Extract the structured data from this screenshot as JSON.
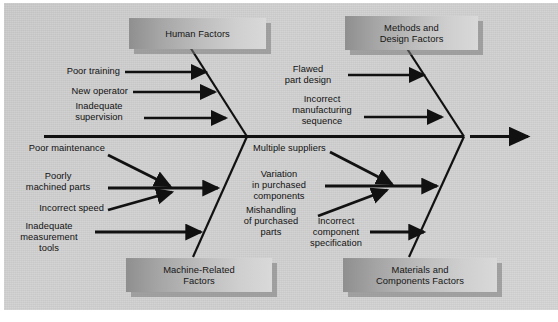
{
  "diagram": {
    "type": "fishbone-cause-and-effect",
    "categories": [
      {
        "id": "human-factors",
        "label": "Human Factors",
        "position": "top-left"
      },
      {
        "id": "methods-and-design-factors",
        "label": "Methods and\nDesign Factors",
        "position": "top-right"
      },
      {
        "id": "machine-related-factors",
        "label": "Machine-Related\nFactors",
        "position": "bottom-left"
      },
      {
        "id": "materials-and-components-factors",
        "label": "Materials and\nComponents Factors",
        "position": "bottom-right"
      }
    ],
    "causes": {
      "human_factors": [
        {
          "id": "poor-training",
          "label": "Poor training"
        },
        {
          "id": "new-operator",
          "label": "New operator"
        },
        {
          "id": "inadequate-supervision",
          "label": "Inadequate\nsupervision"
        }
      ],
      "methods_and_design_factors": [
        {
          "id": "flawed-part-design",
          "label": "Flawed\npart design"
        },
        {
          "id": "incorrect-manufacturing-sequence",
          "label": "Incorrect\nmanufacturing\nsequence"
        }
      ],
      "machine_related_factors": [
        {
          "id": "poor-maintenance",
          "label": "Poor maintenance"
        },
        {
          "id": "poorly-machined-parts",
          "label": "Poorly\nmachined parts"
        },
        {
          "id": "incorrect-speed",
          "label": "Incorrect speed"
        },
        {
          "id": "inadequate-measurement-tools",
          "label": "Inadequate\nmeasurement\ntools"
        }
      ],
      "materials_and_components_factors": [
        {
          "id": "multiple-suppliers",
          "label": "Multiple suppliers"
        },
        {
          "id": "variation-in-purchased-components",
          "label": "Variation\nin purchased\ncomponents"
        },
        {
          "id": "mishandling-of-purchased-parts",
          "label": "Mishandling\nof purchased\nparts"
        },
        {
          "id": "incorrect-component-specification",
          "label": "Incorrect\ncomponent\nspecification"
        }
      ]
    },
    "colors": {
      "panel_background": "#cfcfcf",
      "box_gradient_dark": "#8f8f8f",
      "box_gradient_light": "#d9d9d9",
      "box_shadow": "#787878",
      "line": "#111111",
      "text": "#111111"
    }
  }
}
